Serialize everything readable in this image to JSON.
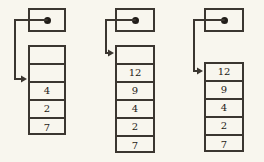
{
  "figure": {
    "title": "",
    "background_color": "#f8f6ee",
    "line_color": "#3b3630",
    "text_color": "#1d1916",
    "diagram_count": 3
  },
  "diagrams": [
    {
      "id": "diagram-1",
      "label": "stack-pointer-state-1",
      "pointer_box": {
        "dot": "filled-dot",
        "x": 28,
        "y": 8,
        "w": 38,
        "h": 24
      },
      "arrow": {
        "from": "pointer-dot",
        "to_cell_index": 1,
        "corner_x": 15,
        "target_y": 79
      },
      "stack": {
        "x": 28,
        "y": 45,
        "w": 38,
        "cell_h": 18,
        "cells": [
          {
            "index": 0,
            "value": ""
          },
          {
            "index": 1,
            "value": ""
          },
          {
            "index": 2,
            "value": "4"
          },
          {
            "index": 3,
            "value": "2"
          },
          {
            "index": 4,
            "value": "7"
          }
        ]
      }
    },
    {
      "id": "diagram-2",
      "label": "stack-pointer-state-2",
      "pointer_box": {
        "dot": "filled-dot",
        "x": 115,
        "y": 8,
        "w": 40,
        "h": 24
      },
      "arrow": {
        "from": "pointer-dot",
        "to_cell_index": 0,
        "corner_x": 106,
        "target_y": 53
      },
      "stack": {
        "x": 115,
        "y": 45,
        "w": 40,
        "cell_h": 18,
        "cells": [
          {
            "index": 0,
            "value": ""
          },
          {
            "index": 1,
            "value": "12"
          },
          {
            "index": 2,
            "value": "9"
          },
          {
            "index": 3,
            "value": "4"
          },
          {
            "index": 4,
            "value": "2"
          },
          {
            "index": 5,
            "value": "7"
          }
        ]
      }
    },
    {
      "id": "diagram-3",
      "label": "stack-pointer-state-3",
      "pointer_box": {
        "dot": "filled-dot",
        "x": 204,
        "y": 8,
        "w": 40,
        "h": 24
      },
      "arrow": {
        "from": "pointer-dot",
        "to_cell_index": 0,
        "corner_x": 194,
        "target_y": 71
      },
      "stack": {
        "x": 204,
        "y": 62,
        "w": 40,
        "cell_h": 18,
        "cells": [
          {
            "index": 0,
            "value": "12"
          },
          {
            "index": 1,
            "value": "9"
          },
          {
            "index": 2,
            "value": "4"
          },
          {
            "index": 3,
            "value": "2"
          },
          {
            "index": 4,
            "value": "7"
          }
        ]
      }
    }
  ]
}
